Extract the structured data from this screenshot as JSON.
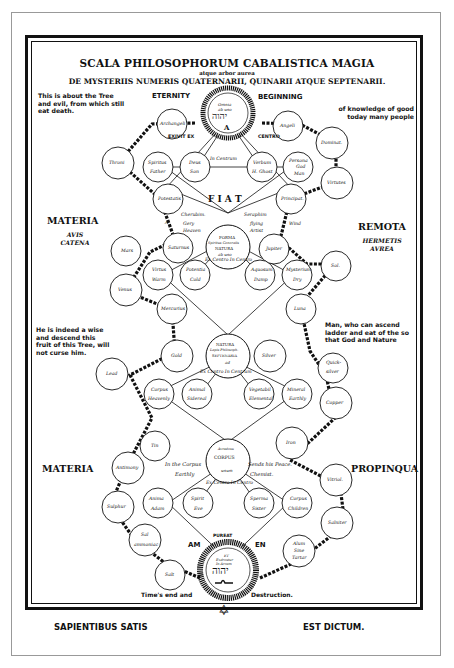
{
  "header": {
    "title": "SCALA PHILOSOPHORUM CABALISTICA MAGIA",
    "subtitle_small": "atque arbor aurea",
    "subtitle": "DE MYSTERIIS NUMERIS QUATERNARII, QUINARII ATQUE SEPTENARII."
  },
  "notes": {
    "top_left": "This is about the Tree and evil, from which still eat death.",
    "top_right": "of knowledge of good today many people",
    "mid_left": "He is indeed a wise and descend this fruit of this Tree, will not curse him.",
    "mid_right": "Man, who can ascend ladder and eat of the so that God and Nature"
  },
  "side_labels": {
    "eternity": "ETERNITY",
    "beginning": "BEGINNING",
    "materia_top": "MATERIA",
    "materia_top_sub1": "AVIS",
    "materia_top_sub2": "CATENA",
    "remota": "REMOTA",
    "remota_sub1": "HERMETIS",
    "remota_sub2": "AVREA",
    "materia_bottom": "MATERIA",
    "propinqua": "PROPINQUA",
    "am": "AM",
    "en": "EN"
  },
  "connectors": {
    "exivit_ex": "EXIVIT EX",
    "centro": "CENTRO",
    "in_centrum": "In Centrum",
    "fiat": "F I A T",
    "a_left": "A",
    "wind": "Wind",
    "cherubim": "Cherubim.",
    "gery": "Gery",
    "heaven": "Heaven",
    "seraphim": "Seraphim",
    "flying": "flying",
    "artist": "Artist",
    "ex_centro_top": "Ex Centro In Centro",
    "ex_centro_mid": "Ex Centro In Centrum",
    "in_the_corpus": "In the Corpus",
    "earthly": "Earthly",
    "sends_his_peace": "Sends his Peace.",
    "chemist": "Chemist.",
    "ex_centro_bottom": "Ex Centro In Centro",
    "times_end": "Time's end and",
    "destruction": "Destruction."
  },
  "medallions": {
    "top": {
      "line1": "Omnia",
      "line2": "ab uno",
      "hebrew": "יהוה",
      "letter": "A"
    },
    "forma": {
      "line1": "FORMA",
      "line2": "Spiritus Generalis",
      "line3": "NATURA",
      "line4": "ab uno"
    },
    "natura": {
      "line1": "NATURA",
      "line2": "Lapis Philosoph.",
      "line3": "SEPTENARIA",
      "line4": "ad"
    },
    "corpus": {
      "line1": "Avradesu",
      "line2": "CORPUS",
      "line3": "unum"
    },
    "bottom": {
      "line0": "PUREAT",
      "line1": "ET",
      "line2": "Exdrestur",
      "line3": "In Arcam",
      "hebrew": "יהוה"
    }
  },
  "circles": {
    "archangeli": "Archangeli",
    "angeli": "Angeli",
    "throni": "Throni",
    "dominat": "Dominat.",
    "spiritus_father": [
      "Spiritus",
      "Father"
    ],
    "deus_son": [
      "Deus",
      "Son"
    ],
    "verbum_hghost": [
      "Verbum",
      "H. Ghost"
    ],
    "persona_godman": [
      "Persona",
      "God",
      "Man"
    ],
    "virtutes": "Virtutes",
    "potestatis": "Potestatis",
    "principat": "Principat.",
    "saturnus": "Saturnus",
    "jupiter": "Jupiter",
    "mars": "Mars",
    "sol": "Sol.",
    "venus": "Venus",
    "luna": "Luna",
    "mercurius": "Mercurius",
    "virtus_warm": [
      "Virtus",
      "Warm"
    ],
    "potentia_cold": [
      "Potentia",
      "Cold"
    ],
    "aquosum_damp": [
      "Aquosum",
      "Damp"
    ],
    "mysterium_dry": [
      "Mysterium",
      "Dry"
    ],
    "gold": "Gold",
    "silver": "Silver",
    "lead": "Lead",
    "quicksilver": [
      "Quick-",
      "silver"
    ],
    "corpus_heavenly": [
      "Corpus",
      "Heavenly"
    ],
    "animal_sidereal": [
      "Animal",
      "Sidereal"
    ],
    "vegetabil_elemental": [
      "Vegetabil",
      "Elemental"
    ],
    "mineral_earthly": [
      "Mineral",
      "Earthly"
    ],
    "copper": "Copper",
    "tin": "Tin",
    "iron": "Iron",
    "antimony": "Antimony",
    "vitriol": "Vitriol.",
    "sulphur": "Sulphur",
    "anima_adam": [
      "Anima",
      "Adam"
    ],
    "spirit_eve": [
      "Spirit",
      "Eve"
    ],
    "sperma_sister": [
      "Sperma",
      "Sister"
    ],
    "corpus_children": [
      "Corpus",
      "Children"
    ],
    "salniter": "Salniter",
    "sal_ammoniac": [
      "Sal",
      "ammoniac"
    ],
    "alum_sine_tartar": [
      "Alum",
      "Sine",
      "Tartar"
    ],
    "salt": "Salt"
  },
  "footer": {
    "left": "SAPIENTIBUS SATIS",
    "right": "EST DICTUM.",
    "star": "✡"
  }
}
